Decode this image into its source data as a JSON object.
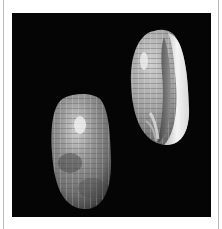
{
  "image": {
    "alt": "Two olive sea shells photographed on a black background",
    "background_color": "#050505",
    "page_color": "#ffffff",
    "border_line_color": "#b8b8b8",
    "subjects": [
      {
        "name": "shell-dorsal-view",
        "description": "Olive shell, dorsal side, grey with checkered banding",
        "base_color": "#8a8a8a"
      },
      {
        "name": "shell-apertural-view",
        "description": "Olive shell, apertural side showing white lip and opening",
        "base_color": "#a8a8a8",
        "lip_color": "#f2f2f2"
      }
    ]
  }
}
